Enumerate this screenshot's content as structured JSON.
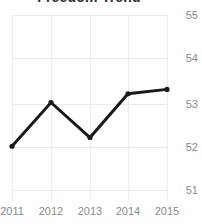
{
  "chart_data": {
    "type": "line",
    "title": "Freedom Trend",
    "xlabel": "",
    "ylabel": "",
    "categories": [
      "2011",
      "2012",
      "2013",
      "2014",
      "2015"
    ],
    "x": [
      2011,
      2012,
      2013,
      2014,
      2015
    ],
    "values": [
      52.0,
      53.0,
      52.2,
      53.2,
      53.3
    ],
    "series": [
      {
        "name": "Freedom Trend",
        "values": [
          52.0,
          53.0,
          52.2,
          53.2,
          53.3
        ]
      }
    ],
    "ylim": [
      51,
      55
    ],
    "yticks": [
      55,
      54,
      53,
      52,
      51
    ],
    "ytick_labels": [
      "55",
      "54",
      "53",
      "52",
      "51"
    ],
    "xtick_labels": [
      "2011",
      "2012",
      "2013",
      "2014",
      "2015"
    ],
    "grid": true,
    "legend": false,
    "legend_position": "none",
    "markers": true,
    "line_color": "#1a1a1a",
    "grid_color": "#e9e9e9",
    "tick_label_color": "#8a8a8a",
    "background_color": "#ffffff"
  }
}
